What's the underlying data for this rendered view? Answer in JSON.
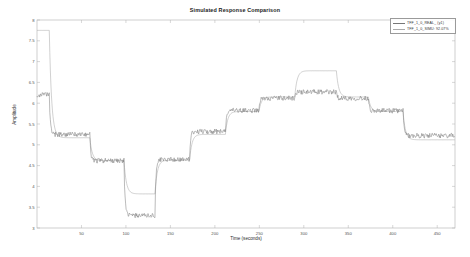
{
  "figure": {
    "title": "Simulated Response Comparison",
    "background": "#ffffff",
    "axes_color": "#b0b0b0",
    "tick_color": "#555555"
  },
  "axes": {
    "xlabel": "Time (seconds)",
    "ylabel": "Amplitude",
    "xticks": [
      "50",
      "100",
      "150",
      "200",
      "250",
      "300",
      "350",
      "400",
      "450"
    ],
    "yticks": [
      "3",
      "3.5",
      "4",
      "4.5",
      "5",
      "5.5",
      "6",
      "6.5",
      "7",
      "7.5",
      "8"
    ],
    "xlim": [
      0,
      470
    ],
    "ylim": [
      3,
      8
    ],
    "grid": false
  },
  "legend": {
    "position": "top-right",
    "entries": [
      {
        "label": "TFF_1_0_REAL_ (y1)",
        "color": "#777777",
        "style": "solid"
      },
      {
        "label": "TFF_1_0_SIMU: 92.07%",
        "color": "#aaaaaa",
        "style": "solid"
      }
    ]
  },
  "chart_data": {
    "type": "line",
    "title": "Simulated Response Comparison",
    "xlabel": "Time (seconds)",
    "ylabel": "Amplitude",
    "xlim": [
      0,
      470
    ],
    "ylim": [
      3,
      8
    ],
    "xticks": [
      50,
      100,
      150,
      200,
      250,
      300,
      350,
      400,
      450
    ],
    "yticks": [
      3,
      3.5,
      4,
      4.5,
      5,
      5.5,
      6,
      6.5,
      7,
      7.5,
      8
    ],
    "grid": false,
    "legend_position": "upper right",
    "series": [
      {
        "name": "TFF_1_0_REAL_ (y1)",
        "color": "#777777",
        "description": "Measured noisy output, piecewise-constant step levels with measurement noise",
        "steps": [
          {
            "t_start": 0,
            "t_end": 14,
            "level": 6.2
          },
          {
            "t_start": 14,
            "t_end": 60,
            "level": 5.25
          },
          {
            "t_start": 60,
            "t_end": 98,
            "level": 4.62
          },
          {
            "t_start": 98,
            "t_end": 133,
            "level": 3.3
          },
          {
            "t_start": 133,
            "t_end": 172,
            "level": 4.65
          },
          {
            "t_start": 172,
            "t_end": 212,
            "level": 5.32
          },
          {
            "t_start": 212,
            "t_end": 250,
            "level": 5.82
          },
          {
            "t_start": 250,
            "t_end": 290,
            "level": 6.12
          },
          {
            "t_start": 290,
            "t_end": 337,
            "level": 6.27
          },
          {
            "t_start": 337,
            "t_end": 373,
            "level": 6.12
          },
          {
            "t_start": 373,
            "t_end": 412,
            "level": 5.82
          },
          {
            "t_start": 412,
            "t_end": 470,
            "level": 5.22
          }
        ],
        "noise_amplitude": 0.06
      },
      {
        "name": "TFF_1_0_SIMU: 92.07%",
        "color": "#aaaaaa",
        "description": "Model simulated output, smooth first-order transitions with initial transient overshoot peak",
        "steps": [
          {
            "t_start": 0,
            "t_end": 14,
            "level": 7.75
          },
          {
            "t_start": 14,
            "t_end": 60,
            "level": 5.17
          },
          {
            "t_start": 60,
            "t_end": 98,
            "level": 4.62
          },
          {
            "t_start": 98,
            "t_end": 133,
            "level": 3.82
          },
          {
            "t_start": 133,
            "t_end": 172,
            "level": 4.63
          },
          {
            "t_start": 172,
            "t_end": 212,
            "level": 5.25
          },
          {
            "t_start": 212,
            "t_end": 250,
            "level": 5.8
          },
          {
            "t_start": 250,
            "t_end": 290,
            "level": 6.15
          },
          {
            "t_start": 290,
            "t_end": 337,
            "level": 6.78
          },
          {
            "t_start": 337,
            "t_end": 373,
            "level": 6.15
          },
          {
            "t_start": 373,
            "t_end": 412,
            "level": 5.8
          },
          {
            "t_start": 412,
            "t_end": 470,
            "level": 5.12
          }
        ],
        "peak": {
          "t": 10,
          "value": 7.75
        },
        "fit_percent": 92.07
      }
    ]
  }
}
